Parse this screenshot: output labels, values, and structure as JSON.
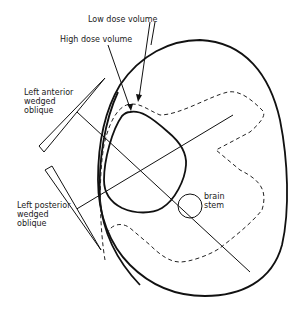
{
  "diagram": {
    "labels": {
      "low_dose": "Low dose volume",
      "high_dose": "High dose volume",
      "left_anterior_1": "Left anterior",
      "left_anterior_2": "wedged",
      "left_anterior_3": "oblique",
      "left_posterior_1": "Left posterior",
      "left_posterior_2": "wedged",
      "left_posterior_3": "oblique",
      "brain_stem_1": "brain",
      "brain_stem_2": "stem"
    },
    "colors": {
      "line": "#111111",
      "background": "#ffffff"
    }
  }
}
